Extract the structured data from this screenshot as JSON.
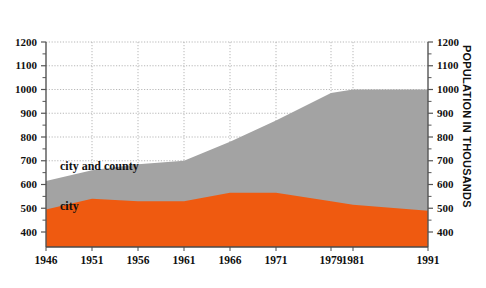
{
  "chart_data": {
    "type": "area",
    "title": "",
    "subtitle": "",
    "xlabel": "",
    "ylabel": "POPULATION IN THOUSANDS",
    "ylabel_right": "POPULATION IN THOUSANDS",
    "stacked": false,
    "grid": true,
    "legend_position": "inline-annotation",
    "ylim": [
      350,
      1230
    ],
    "y_axis_visible_min": 400,
    "y_axis_visible_max": 1200,
    "yticks": [
      400,
      500,
      600,
      700,
      800,
      900,
      1000,
      1100,
      1200
    ],
    "ytick_labels": [
      "400",
      "500",
      "600",
      "700",
      "800",
      "900",
      "1000",
      "1100",
      "1200"
    ],
    "yminor_step": 50,
    "categories": [
      1946,
      1951,
      1956,
      1961,
      1966,
      1971,
      1979,
      1981,
      1991
    ],
    "xtick_labels": [
      "1946",
      "1951",
      "1956",
      "1961",
      "1966",
      "1971",
      "1979",
      "1981",
      "1991"
    ],
    "x_positions_px": [
      46,
      92,
      138,
      184,
      230,
      276,
      331,
      353,
      428
    ],
    "series": [
      {
        "name": "city and county",
        "color": "#a3a3a3",
        "label_text": "city and county",
        "values": [
          615,
          660,
          685,
          700,
          780,
          870,
          985,
          1000,
          1000
        ]
      },
      {
        "name": "city",
        "color": "#ef5a10",
        "label_text": "city",
        "values": [
          495,
          540,
          530,
          530,
          565,
          565,
          530,
          515,
          490
        ]
      }
    ],
    "annotations": [
      {
        "text": "city and county",
        "x_px": 60,
        "y_px": 170
      },
      {
        "text": "city",
        "x_px": 60,
        "y_px": 210
      }
    ],
    "colors": {
      "city_and_county": "#a3a3a3",
      "city": "#ef5a10",
      "gridline": "#9a9a9a",
      "axis": "#555555",
      "text": "#111111",
      "background": "#ffffff"
    }
  }
}
